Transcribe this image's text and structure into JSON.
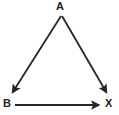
{
  "diagram": {
    "type": "vector-triangle",
    "canvas": {
      "width": 119,
      "height": 115,
      "background": "#ffffff"
    },
    "stroke_color": "#262626",
    "stroke_width": 1.8,
    "vertices": [
      {
        "id": "A",
        "label": "A",
        "x": 60,
        "y": 14,
        "label_x": 56,
        "label_y": 1
      },
      {
        "id": "B",
        "label": "B",
        "x": 11,
        "y": 95,
        "label_x": 3,
        "label_y": 98
      },
      {
        "id": "X",
        "label": "X",
        "x": 108,
        "y": 95,
        "label_x": 105,
        "label_y": 98
      }
    ],
    "arrows": [
      {
        "id": "A-to-B",
        "name": "arrow-a-to-b",
        "from": "A",
        "to": "B",
        "x1": 61,
        "y1": 16,
        "x2": 12,
        "y2": 93,
        "arrowhead": "end",
        "direction": "down-left"
      },
      {
        "id": "A-to-X",
        "name": "arrow-a-to-x",
        "from": "A",
        "to": "X",
        "x1": 62,
        "y1": 16,
        "x2": 107,
        "y2": 93,
        "arrowhead": "end",
        "direction": "down-right"
      },
      {
        "id": "B-to-X",
        "name": "arrow-b-to-x",
        "from": "B",
        "to": "X",
        "x1": 15,
        "y1": 105,
        "x2": 101,
        "y2": 105,
        "arrowhead": "end",
        "direction": "right"
      }
    ]
  }
}
